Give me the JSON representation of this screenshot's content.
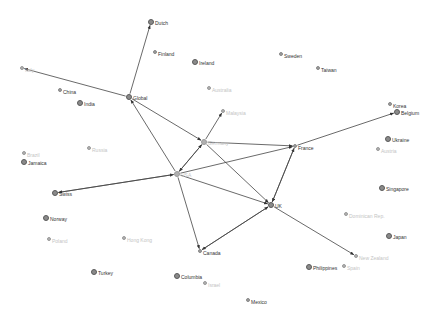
{
  "diagram": {
    "type": "directed-network-graph",
    "edge_color": "#444444",
    "node_color": "#8a8a8a",
    "label_color": "#333333",
    "faded_label_color": "#c4c4c4"
  },
  "nodes": [
    {
      "id": "dutch",
      "label": "Dutch",
      "x": 151,
      "y": 22,
      "size": "big",
      "faded": false
    },
    {
      "id": "finland",
      "label": "Finland",
      "x": 155,
      "y": 52,
      "size": "small",
      "faded": false
    },
    {
      "id": "ireland",
      "label": "Ireland",
      "x": 195,
      "y": 62,
      "size": "big",
      "faded": false
    },
    {
      "id": "sweden",
      "label": "Sweden",
      "x": 281,
      "y": 54,
      "size": "small",
      "faded": false
    },
    {
      "id": "taiwan",
      "label": "Taiwan",
      "x": 318,
      "y": 68,
      "size": "small",
      "faded": false
    },
    {
      "id": "italy",
      "label": "Italy",
      "x": 22,
      "y": 68,
      "size": "small",
      "faded": true
    },
    {
      "id": "china",
      "label": "China",
      "x": 60,
      "y": 90,
      "size": "small",
      "faded": false
    },
    {
      "id": "india",
      "label": "India",
      "x": 80,
      "y": 103,
      "size": "big",
      "faded": false
    },
    {
      "id": "global",
      "label": "Global",
      "x": 129,
      "y": 97,
      "size": "big",
      "faded": false
    },
    {
      "id": "australia",
      "label": "Australia",
      "x": 209,
      "y": 88,
      "size": "small",
      "faded": true
    },
    {
      "id": "malaysia",
      "label": "Malaysia",
      "x": 223,
      "y": 111,
      "size": "small",
      "faded": true
    },
    {
      "id": "korea",
      "label": "Korea",
      "x": 390,
      "y": 104,
      "size": "small",
      "faded": false
    },
    {
      "id": "belgium",
      "label": "Belgium",
      "x": 397,
      "y": 112,
      "size": "big",
      "faded": false
    },
    {
      "id": "germany",
      "label": "Germany",
      "x": 204,
      "y": 142,
      "size": "big",
      "faded": true
    },
    {
      "id": "france",
      "label": "France",
      "x": 295,
      "y": 146,
      "size": "small",
      "faded": false
    },
    {
      "id": "ukraine",
      "label": "Ukraine",
      "x": 388,
      "y": 139,
      "size": "big",
      "faded": false
    },
    {
      "id": "austria",
      "label": "Austria",
      "x": 378,
      "y": 149,
      "size": "small",
      "faded": true
    },
    {
      "id": "brazil",
      "label": "Brazil",
      "x": 24,
      "y": 153,
      "size": "small",
      "faded": true
    },
    {
      "id": "russia",
      "label": "Russia",
      "x": 89,
      "y": 148,
      "size": "small",
      "faded": true
    },
    {
      "id": "jamaica",
      "label": "Jamaica",
      "x": 24,
      "y": 162,
      "size": "big",
      "faded": false
    },
    {
      "id": "usa",
      "label": "USA",
      "x": 177,
      "y": 174,
      "size": "big",
      "faded": true
    },
    {
      "id": "swiss",
      "label": "Swiss",
      "x": 55,
      "y": 193,
      "size": "big",
      "faded": false
    },
    {
      "id": "singapore",
      "label": "Singapore",
      "x": 382,
      "y": 188,
      "size": "big",
      "faded": false
    },
    {
      "id": "uk",
      "label": "UK",
      "x": 271,
      "y": 205,
      "size": "big",
      "faded": false
    },
    {
      "id": "dominican",
      "label": "Dominican Rep.",
      "x": 346,
      "y": 214,
      "size": "small",
      "faded": true
    },
    {
      "id": "norway",
      "label": "Norway",
      "x": 46,
      "y": 218,
      "size": "big",
      "faded": false
    },
    {
      "id": "poland",
      "label": "Poland",
      "x": 49,
      "y": 239,
      "size": "small",
      "faded": true
    },
    {
      "id": "hongkong",
      "label": "Hong Kong",
      "x": 124,
      "y": 238,
      "size": "small",
      "faded": true
    },
    {
      "id": "canada",
      "label": "Canada",
      "x": 200,
      "y": 251,
      "size": "small",
      "faded": false
    },
    {
      "id": "japan",
      "label": "Japan",
      "x": 389,
      "y": 236,
      "size": "big",
      "faded": false
    },
    {
      "id": "newzealand",
      "label": "New Zealand",
      "x": 356,
      "y": 256,
      "size": "small",
      "faded": true
    },
    {
      "id": "turkey",
      "label": "Turkey",
      "x": 94,
      "y": 272,
      "size": "big",
      "faded": false
    },
    {
      "id": "philippines",
      "label": "Philippines",
      "x": 309,
      "y": 267,
      "size": "big",
      "faded": false
    },
    {
      "id": "spain",
      "label": "Spain",
      "x": 344,
      "y": 266,
      "size": "small",
      "faded": true
    },
    {
      "id": "columbia",
      "label": "Columbia",
      "x": 177,
      "y": 276,
      "size": "big",
      "faded": false
    },
    {
      "id": "israel",
      "label": "Israel",
      "x": 205,
      "y": 283,
      "size": "small",
      "faded": true
    },
    {
      "id": "mexico",
      "label": "Mexico",
      "x": 248,
      "y": 300,
      "size": "small",
      "faded": false
    }
  ],
  "edges": [
    {
      "from": "global",
      "to": "dutch"
    },
    {
      "from": "global",
      "to": "italy"
    },
    {
      "from": "global",
      "to": "germany"
    },
    {
      "from": "usa",
      "to": "global"
    },
    {
      "from": "germany",
      "to": "usa"
    },
    {
      "from": "usa",
      "to": "germany"
    },
    {
      "from": "germany",
      "to": "malaysia"
    },
    {
      "from": "germany",
      "to": "france"
    },
    {
      "from": "germany",
      "to": "uk"
    },
    {
      "from": "swiss",
      "to": "usa"
    },
    {
      "from": "usa",
      "to": "swiss"
    },
    {
      "from": "usa",
      "to": "france"
    },
    {
      "from": "usa",
      "to": "uk"
    },
    {
      "from": "usa",
      "to": "canada"
    },
    {
      "from": "uk",
      "to": "canada"
    },
    {
      "from": "canada",
      "to": "uk"
    },
    {
      "from": "uk",
      "to": "france"
    },
    {
      "from": "france",
      "to": "uk"
    },
    {
      "from": "france",
      "to": "belgium"
    },
    {
      "from": "uk",
      "to": "newzealand"
    }
  ]
}
